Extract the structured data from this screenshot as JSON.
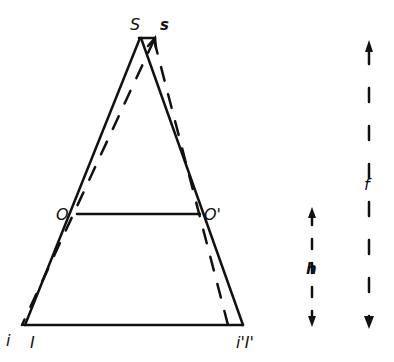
{
  "diagram": {
    "type": "optical-geometry",
    "labels": {
      "apex_S": "S",
      "apex_s": "s",
      "left_mid": "O",
      "right_mid": "O'",
      "base_left_i": "i",
      "base_left_I": "I",
      "base_right": "i'I'",
      "height_h": "h",
      "focal_f": "f"
    },
    "colors": {
      "line": "#111111",
      "background": "#ffffff"
    }
  }
}
